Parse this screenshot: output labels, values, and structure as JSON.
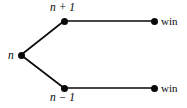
{
  "figure": {
    "type": "tree-diagram",
    "background_color": "#ffffff",
    "line_color": "#0a0a0a",
    "node_color": "#0a0a0a"
  },
  "nodes": [
    {
      "id": "root",
      "label": "n",
      "label_style": "math",
      "x": 21,
      "y": 55,
      "label_position": "left"
    },
    {
      "id": "top-branch",
      "label": "n + 1",
      "label_style": "math",
      "x": 64,
      "y": 21,
      "label_position": "above"
    },
    {
      "id": "bottom-branch",
      "label": "n − 1",
      "label_style": "math",
      "x": 64,
      "y": 88,
      "label_position": "below"
    },
    {
      "id": "top-terminal",
      "label": "win",
      "label_style": "roman",
      "x": 154,
      "y": 21,
      "label_position": "right"
    },
    {
      "id": "bottom-terminal",
      "label": "win",
      "label_style": "roman",
      "x": 154,
      "y": 88,
      "label_position": "right"
    }
  ],
  "edges": [
    {
      "id": "root-to-top",
      "from": "root",
      "to": "top-branch",
      "x1": 21,
      "y1": 55,
      "x2": 64,
      "y2": 21
    },
    {
      "id": "root-to-bottom",
      "from": "root",
      "to": "bottom-branch",
      "x1": 21,
      "y1": 55,
      "x2": 64,
      "y2": 88
    },
    {
      "id": "top-to-top-terminal",
      "from": "top-branch",
      "to": "top-terminal",
      "x1": 64,
      "y1": 21,
      "x2": 154,
      "y2": 21
    },
    {
      "id": "bottom-to-bottom-terminal",
      "from": "bottom-branch",
      "to": "bottom-terminal",
      "x1": 64,
      "y1": 88,
      "x2": 154,
      "y2": 88
    }
  ],
  "labels": {
    "root": "n",
    "top_branch": "n + 1",
    "bottom_branch": "n − 1",
    "top_terminal": "win",
    "bottom_terminal": "win"
  }
}
